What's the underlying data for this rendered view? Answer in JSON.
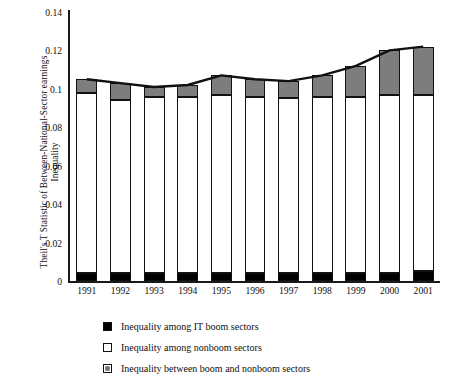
{
  "chart_data": {
    "type": "bar",
    "stacked": true,
    "title": "",
    "xlabel": "",
    "ylabel": "Theil's T Statistic of Between-National-Sector earnings Inequality",
    "ylabel_lines": [
      "Theil's T Statistic of Between-National-Sector earnings",
      "Inequality"
    ],
    "categories": [
      "1991",
      "1992",
      "1993",
      "1994",
      "1995",
      "1996",
      "1997",
      "1998",
      "1999",
      "2000",
      "2001"
    ],
    "ylim": [
      0,
      0.14
    ],
    "yticks": [
      0,
      0.02,
      0.04,
      0.06,
      0.08,
      0.1,
      0.12,
      0.14
    ],
    "ytick_labels": [
      "0",
      "0.02",
      "0.04",
      "0.06",
      "0.08",
      "0.1",
      "0.12",
      "0.14"
    ],
    "grid": false,
    "legend_position": "bottom",
    "series": [
      {
        "name": "Inequality among IT boom sectors",
        "color": "#000000",
        "values": [
          0.004,
          0.004,
          0.004,
          0.004,
          0.004,
          0.004,
          0.004,
          0.004,
          0.004,
          0.004,
          0.005
        ]
      },
      {
        "name": "Inequality among nonboom sectors",
        "color": "#ffffff",
        "values": [
          0.094,
          0.09,
          0.092,
          0.092,
          0.093,
          0.092,
          0.091,
          0.092,
          0.092,
          0.093,
          0.092
        ]
      },
      {
        "name": "Inequality between boom and nonboom sectors",
        "color": "#7d7d7d",
        "values": [
          0.007,
          0.009,
          0.005,
          0.006,
          0.01,
          0.009,
          0.009,
          0.011,
          0.016,
          0.023,
          0.025
        ]
      }
    ],
    "totals": [
      0.105,
      0.103,
      0.101,
      0.102,
      0.107,
      0.105,
      0.104,
      0.107,
      0.112,
      0.12,
      0.122
    ],
    "annotations": []
  },
  "legend": {
    "items": [
      {
        "label": "Inequality among IT boom sectors",
        "marker": "solid-black-square"
      },
      {
        "label": "Inequality among nonboom sectors",
        "marker": "open-white-square"
      },
      {
        "label": "Inequality between boom and nonboom sectors",
        "marker": "gray-square"
      }
    ]
  }
}
